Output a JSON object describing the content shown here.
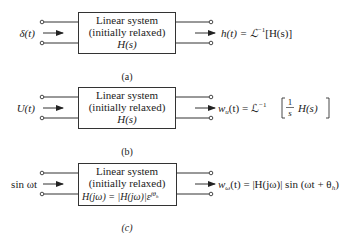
{
  "figure": {
    "panels": [
      {
        "id": "a",
        "caption": "(a)",
        "input_label": "δ(t)",
        "box_lines": [
          "Linear system",
          "(initially relaxed)",
          "H(s)"
        ],
        "output_label": "h(t) = ℒ⁻¹[H(s)]"
      },
      {
        "id": "b",
        "caption": "(b)",
        "input_label": "U(t)",
        "box_lines": [
          "Linear system",
          "(initially relaxed)",
          "H(s)"
        ],
        "output_label": "wᵤ(t) = ℒ⁻¹[ (1/s) H(s) ]",
        "output_parts": {
          "lhs": "w",
          "sub": "u",
          "mid": "(t) = ℒ",
          "sup": "−1",
          "num": "1",
          "den": "s",
          "tail": "H(s)"
        }
      },
      {
        "id": "c",
        "caption": "(c)",
        "input_label": "sin ωt",
        "box_lines": [
          "Linear system",
          "(initially relaxed)",
          "H(jω) = |H(jω)|ε^{jθₕ}"
        ],
        "output_label": "w_ω(t) = |H(jω)| sin (ωt + θₕ)"
      }
    ],
    "colors": {
      "line": "#333333",
      "text": "#222222",
      "background": "#ffffff"
    }
  },
  "text": {
    "a_in": "δ(t)",
    "a_box1": "Linear system",
    "a_box2": "(initially relaxed)",
    "a_box3": "H(s)",
    "a_out_h": "h(t) = ℒ",
    "a_out_sup": "−1",
    "a_out_tail": "[H(s)]",
    "a_cap": "(a)",
    "b_in": "U(t)",
    "b_box1": "Linear system",
    "b_box2": "(initially relaxed)",
    "b_box3": "H(s)",
    "b_out_w": "w",
    "b_out_sub": "u",
    "b_out_mid": "(t) = ℒ",
    "b_out_sup": "−1",
    "b_num": "1",
    "b_den": "s",
    "b_tail": "H(s)",
    "b_cap": "(b)",
    "c_in": "sin ωt",
    "c_box1": "Linear system",
    "c_box2": "(initially relaxed)",
    "c_box3a": "H(jω) = |H(jω)|ε",
    "c_box3sup": "jθ",
    "c_box3sub": "h",
    "c_out_w": "w",
    "c_out_sub": "ω",
    "c_out_tail": "(t) = |H(jω)| sin (ωt + θ",
    "c_out_sub2": "h",
    "c_out_end": ")",
    "c_cap": "(c)"
  }
}
